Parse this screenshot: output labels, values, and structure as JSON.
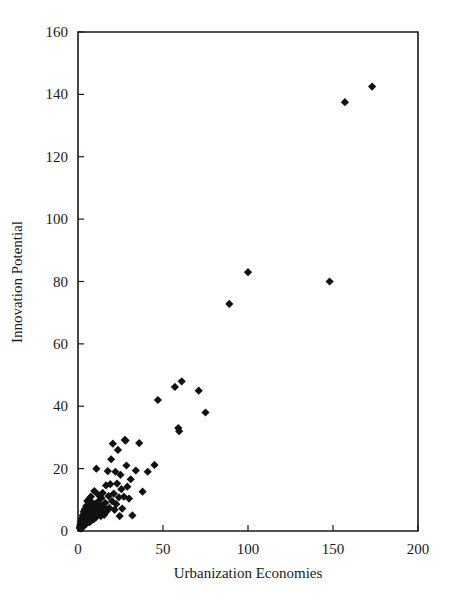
{
  "chart_data": {
    "type": "scatter",
    "title": "",
    "xlabel": "Urbanization Economies",
    "ylabel": "Innovation Potential",
    "xlim": [
      0,
      200
    ],
    "ylim": [
      0,
      160
    ],
    "xticks": [
      0,
      50,
      100,
      150,
      200
    ],
    "yticks": [
      0,
      20,
      40,
      60,
      80,
      100,
      120,
      140,
      160
    ],
    "xtick_labels": [
      "0",
      "50",
      "100",
      "150",
      "200"
    ],
    "ytick_labels": [
      "0",
      "20",
      "40",
      "60",
      "80",
      "100",
      "120",
      "140",
      "160"
    ],
    "grid": false,
    "legend": null,
    "marker": "filled-diamond",
    "marker_color": "#111111",
    "marker_size": 7,
    "series": [
      {
        "name": "Cities",
        "points": [
          [
            1.0,
            1.0
          ],
          [
            1.2,
            1.5
          ],
          [
            1.4,
            2.0
          ],
          [
            1.5,
            0.8
          ],
          [
            1.6,
            2.6
          ],
          [
            1.8,
            1.2
          ],
          [
            1.9,
            3.2
          ],
          [
            2.0,
            2.2
          ],
          [
            2.1,
            1.0
          ],
          [
            2.2,
            4.0
          ],
          [
            2.3,
            2.8
          ],
          [
            2.5,
            1.6
          ],
          [
            2.6,
            3.6
          ],
          [
            2.7,
            5.0
          ],
          [
            2.8,
            2.4
          ],
          [
            3.0,
            1.4
          ],
          [
            3.1,
            4.4
          ],
          [
            3.2,
            3.0
          ],
          [
            3.3,
            6.2
          ],
          [
            3.5,
            2.0
          ],
          [
            3.6,
            5.4
          ],
          [
            3.8,
            3.8
          ],
          [
            3.9,
            2.6
          ],
          [
            4.0,
            7.0
          ],
          [
            4.1,
            4.6
          ],
          [
            4.3,
            3.2
          ],
          [
            4.5,
            5.8
          ],
          [
            4.6,
            2.2
          ],
          [
            4.8,
            8.0
          ],
          [
            5.0,
            4.0
          ],
          [
            5.1,
            6.4
          ],
          [
            5.3,
            3.0
          ],
          [
            5.5,
            9.6
          ],
          [
            5.6,
            5.2
          ],
          [
            5.8,
            7.2
          ],
          [
            6.0,
            3.6
          ],
          [
            6.2,
            4.8
          ],
          [
            6.4,
            10.2
          ],
          [
            6.6,
            6.0
          ],
          [
            6.8,
            2.8
          ],
          [
            7.0,
            8.4
          ],
          [
            7.2,
            4.2
          ],
          [
            7.4,
            5.6
          ],
          [
            7.6,
            11.0
          ],
          [
            7.8,
            3.4
          ],
          [
            8.0,
            6.8
          ],
          [
            8.3,
            9.0
          ],
          [
            8.5,
            4.6
          ],
          [
            8.8,
            7.6
          ],
          [
            9.0,
            5.0
          ],
          [
            9.3,
            3.8
          ],
          [
            9.6,
            12.8
          ],
          [
            10.0,
            6.2
          ],
          [
            10.2,
            8.8
          ],
          [
            10.5,
            4.4
          ],
          [
            10.8,
            20.0
          ],
          [
            11.0,
            7.0
          ],
          [
            11.4,
            5.4
          ],
          [
            11.8,
            9.4
          ],
          [
            12.0,
            11.6
          ],
          [
            12.5,
            6.6
          ],
          [
            13.0,
            8.2
          ],
          [
            13.4,
            4.8
          ],
          [
            13.8,
            10.6
          ],
          [
            14.0,
            6.0
          ],
          [
            14.5,
            12.2
          ],
          [
            15.0,
            7.8
          ],
          [
            15.4,
            5.2
          ],
          [
            16.0,
            9.0
          ],
          [
            16.5,
            14.6
          ],
          [
            17.0,
            6.4
          ],
          [
            17.5,
            19.2
          ],
          [
            18.0,
            11.2
          ],
          [
            18.4,
            7.4
          ],
          [
            19.0,
            15.0
          ],
          [
            19.5,
            23.0
          ],
          [
            20.0,
            9.6
          ],
          [
            20.5,
            28.0
          ],
          [
            21.0,
            12.0
          ],
          [
            21.5,
            6.8
          ],
          [
            22.0,
            19.0
          ],
          [
            22.5,
            8.6
          ],
          [
            23.0,
            15.2
          ],
          [
            23.5,
            26.0
          ],
          [
            24.0,
            10.8
          ],
          [
            24.5,
            4.8
          ],
          [
            25.0,
            18.0
          ],
          [
            25.5,
            13.4
          ],
          [
            26.0,
            7.2
          ],
          [
            27.0,
            11.0
          ],
          [
            27.5,
            29.2
          ],
          [
            28.0,
            29.0
          ],
          [
            28.5,
            21.0
          ],
          [
            29.0,
            14.2
          ],
          [
            30.0,
            10.4
          ],
          [
            31.0,
            16.6
          ],
          [
            32.0,
            5.0
          ],
          [
            34.0,
            19.4
          ],
          [
            36.0,
            28.2
          ],
          [
            38.0,
            12.6
          ],
          [
            41.0,
            19.0
          ],
          [
            45.0,
            21.2
          ],
          [
            47.0,
            42.0
          ],
          [
            57.0,
            46.2
          ],
          [
            59.0,
            33.0
          ],
          [
            59.5,
            32.0
          ],
          [
            61.0,
            48.0
          ],
          [
            71.0,
            45.0
          ],
          [
            75.0,
            38.0
          ],
          [
            89.0,
            72.8
          ],
          [
            100.0,
            83.0
          ],
          [
            148.0,
            80.0
          ],
          [
            157.0,
            137.5
          ],
          [
            173.0,
            142.5
          ]
        ]
      }
    ]
  },
  "axes": {
    "x_axis_name": "x-axis",
    "y_axis_name": "y-axis"
  }
}
